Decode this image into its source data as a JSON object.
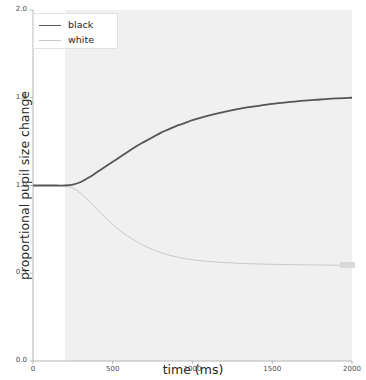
{
  "chart_data": {
    "type": "line",
    "title": "",
    "xlabel": "time (ms)",
    "ylabel": "proportional pupil size change",
    "xlim": [
      0,
      2000
    ],
    "ylim": [
      0.0,
      2.0
    ],
    "xticks": [
      0,
      500,
      1000,
      1500,
      2000
    ],
    "xtick_labels": [
      "0",
      "500",
      "1000",
      "1500",
      "2000"
    ],
    "yticks": [
      0.0,
      0.5,
      1.0,
      1.5,
      2.0
    ],
    "ytick_labels": [
      "0.0",
      "0.5",
      "1.0",
      "1.5",
      "2.0"
    ],
    "grid": false,
    "legend_position": "upper left",
    "shaded_region": {
      "x_start": 200,
      "x_end": 2000,
      "color": "#f0f0f0",
      "label": "stimulus interval"
    },
    "series": [
      {
        "name": "black",
        "color": "#555555",
        "linewidth": 1.8,
        "x": [
          0,
          50,
          100,
          150,
          200,
          250,
          300,
          350,
          400,
          450,
          500,
          550,
          600,
          650,
          700,
          750,
          800,
          850,
          900,
          950,
          1000,
          1100,
          1200,
          1300,
          1400,
          1500,
          1600,
          1700,
          1800,
          1900,
          2000
        ],
        "y": [
          1.0,
          1.0,
          1.0,
          1.0,
          1.0,
          1.005,
          1.02,
          1.045,
          1.075,
          1.105,
          1.135,
          1.165,
          1.195,
          1.225,
          1.25,
          1.275,
          1.3,
          1.32,
          1.34,
          1.355,
          1.372,
          1.398,
          1.42,
          1.438,
          1.452,
          1.465,
          1.475,
          1.484,
          1.49,
          1.496,
          1.5
        ]
      },
      {
        "name": "white",
        "color": "#c8c8c8",
        "linewidth": 1.0,
        "x": [
          0,
          50,
          100,
          150,
          200,
          250,
          300,
          350,
          400,
          450,
          500,
          550,
          600,
          650,
          700,
          750,
          800,
          850,
          900,
          950,
          1000,
          1100,
          1200,
          1300,
          1400,
          1500,
          1600,
          1700,
          1800,
          1900,
          2000
        ],
        "y": [
          1.0,
          1.0,
          1.0,
          1.0,
          1.0,
          0.985,
          0.955,
          0.912,
          0.865,
          0.82,
          0.778,
          0.74,
          0.708,
          0.68,
          0.655,
          0.635,
          0.618,
          0.604,
          0.593,
          0.584,
          0.577,
          0.567,
          0.561,
          0.556,
          0.553,
          0.551,
          0.549,
          0.548,
          0.547,
          0.546,
          0.545
        ]
      }
    ],
    "end_marker": {
      "series": "white",
      "x": 1930,
      "y": 0.545,
      "color": "#d9d9d9"
    }
  },
  "legend": {
    "entries": [
      {
        "label": "black",
        "color": "#555555",
        "linewidth": 1.8
      },
      {
        "label": "white",
        "color": "#c8c8c8",
        "linewidth": 1.0
      }
    ]
  },
  "style": {
    "background": "#ffffff",
    "axis_color": "#b5b5b5",
    "tick_text_color": "#4d4d4d",
    "label_text_color": "#262626",
    "shade_color": "#f0f0f0"
  }
}
